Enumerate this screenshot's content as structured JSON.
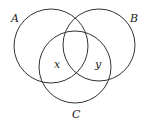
{
  "diagram": {
    "type": "venn",
    "sets": [
      {
        "name": "A",
        "cx": 51,
        "cy": 46,
        "r": 37
      },
      {
        "name": "B",
        "cx": 99,
        "cy": 45,
        "r": 36
      },
      {
        "name": "C",
        "cx": 75,
        "cy": 67,
        "r": 36
      }
    ],
    "labels": {
      "A": "A",
      "B": "B",
      "C": "C",
      "x": "x",
      "y": "y"
    }
  }
}
